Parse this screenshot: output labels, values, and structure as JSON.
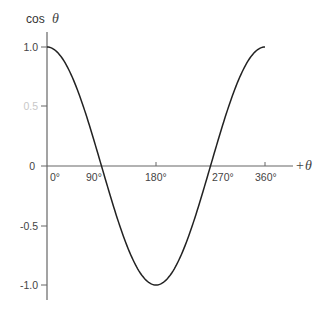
{
  "chart_data": {
    "type": "line",
    "title": "",
    "xlabel": "+θ",
    "ylabel": "cos θ",
    "ylabel_parts": {
      "text": "cos",
      "symbol": "θ"
    },
    "xlabel_parts": {
      "sign": "+",
      "symbol": "θ"
    },
    "x_ticks": [
      "0°",
      "90°",
      "180°",
      "270°",
      "360°"
    ],
    "y_ticks": [
      "1.0",
      "0.5",
      "0",
      "-0.5",
      "-1.0"
    ],
    "xlim": [
      0,
      360
    ],
    "ylim": [
      -1.0,
      1.0
    ],
    "grid": false,
    "legend": null,
    "series": [
      {
        "name": "cos θ",
        "x": [
          0,
          30,
          60,
          90,
          120,
          150,
          180,
          210,
          240,
          270,
          300,
          330,
          360
        ],
        "values": [
          1.0,
          0.866,
          0.5,
          0.0,
          -0.5,
          -0.866,
          -1.0,
          -0.866,
          -0.5,
          0.0,
          0.5,
          0.866,
          1.0
        ]
      }
    ],
    "colors": {
      "curve": "#222222",
      "axis": "#555555"
    }
  }
}
